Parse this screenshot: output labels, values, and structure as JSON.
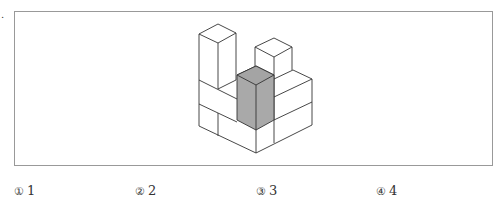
{
  "question": {
    "marker": "."
  },
  "figure": {
    "shaded_color": "#a9a9a9",
    "line_color": "#333333"
  },
  "options": [
    {
      "mark": "①",
      "value": "1"
    },
    {
      "mark": "②",
      "value": "2"
    },
    {
      "mark": "③",
      "value": "3"
    },
    {
      "mark": "④",
      "value": "4"
    }
  ]
}
